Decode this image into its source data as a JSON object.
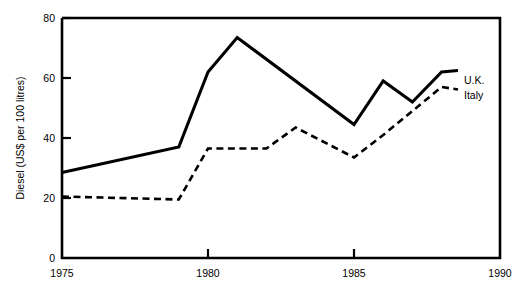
{
  "chart_data": {
    "type": "line",
    "title": "",
    "subtitle": "",
    "xlabel": "",
    "ylabel": "Diesel (US$ per 100 litres)",
    "xlim": [
      1975,
      1990
    ],
    "ylim": [
      0,
      80
    ],
    "grid": false,
    "legend_position": "right-inline-end-of-line",
    "x_ticks": [
      "1975",
      "1980",
      "1985",
      "1990"
    ],
    "x_tick_values": [
      1975,
      1980,
      1985,
      1990
    ],
    "y_ticks": [
      "0",
      "20",
      "40",
      "60",
      "80"
    ],
    "y_tick_values": [
      0,
      20,
      40,
      60,
      80
    ],
    "series": [
      {
        "name": "U.K.",
        "style": "solid",
        "color": "#000000",
        "x": [
          1975,
          1979,
          1980,
          1981,
          1985,
          1986,
          1987,
          1988
        ],
        "values": [
          28.5,
          37.0,
          62.0,
          73.5,
          44.5,
          59.0,
          52.0,
          62.0
        ]
      },
      {
        "name": "Italy",
        "style": "dashed",
        "color": "#000000",
        "x": [
          1975,
          1979,
          1980,
          1982,
          1983,
          1985,
          1986,
          1988
        ],
        "values": [
          20.5,
          19.5,
          36.5,
          36.5,
          43.5,
          33.5,
          41.0,
          57.0
        ]
      }
    ]
  },
  "axes": {
    "y_axis_title": "Diesel (US$ per 100 litres)",
    "y_tick_labels": [
      "80",
      "60",
      "40",
      "20",
      "0"
    ],
    "x_tick_labels": [
      "1975",
      "1980",
      "1985",
      "1990"
    ]
  },
  "legend": {
    "uk_label": "U.K.",
    "italy_label": "Italy"
  }
}
